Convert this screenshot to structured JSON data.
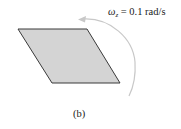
{
  "figure": {
    "label": "(b)",
    "angular_velocity": {
      "symbol": "ω",
      "subscript": "z",
      "equals": " = ",
      "value": "0.1 rad/s"
    },
    "shape": {
      "type": "parallelogram",
      "fill": "#d4d4d4",
      "stroke": "#3a3a3a"
    },
    "rotation_arrow": {
      "direction": "counterclockwise",
      "color": "#c8c8c8"
    }
  }
}
